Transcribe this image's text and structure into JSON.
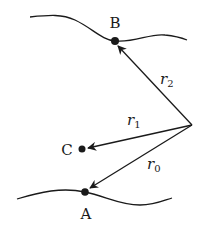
{
  "diagram": {
    "points": {
      "A": {
        "label": "A"
      },
      "B": {
        "label": "B"
      },
      "C": {
        "label": "C"
      }
    },
    "vectors": [
      {
        "name": "r0",
        "symbol": "r",
        "subscript": "0",
        "from": "O",
        "to": "A"
      },
      {
        "name": "r1",
        "symbol": "r",
        "subscript": "1",
        "from": "O",
        "to": "C"
      },
      {
        "name": "r2",
        "symbol": "r",
        "subscript": "2",
        "from": "O",
        "to": "B"
      }
    ],
    "colors": {
      "stroke": "#1a1a1a",
      "background": "#ffffff"
    }
  }
}
